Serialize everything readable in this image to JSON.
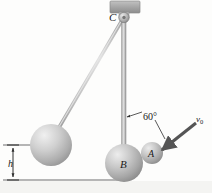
{
  "figure": {
    "background_color": "#fdfdfc",
    "labels": {
      "pivot": "C",
      "sphere_large": "B",
      "sphere_small": "A",
      "angle": "60°",
      "velocity": "v",
      "velocity_subscript": "0",
      "height": "h"
    },
    "colors": {
      "sphere_fill_light": "#e6e6e6",
      "sphere_fill_mid": "#b8b8b8",
      "sphere_fill_dark": "#8e8e8e",
      "rod_light": "#d8d8d8",
      "rod_dark": "#a0a0a0",
      "ceiling_fill": "#a9a9a9",
      "line_color": "#6e6e6e",
      "text_color": "#1a1a1a",
      "arrow_color": "#555555"
    }
  },
  "geometry": {
    "pivot": {
      "x": 124,
      "y": 16
    },
    "sphere_b_rest": {
      "cx": 124,
      "cy": 163,
      "r": 19
    },
    "sphere_b_raised": {
      "cx": 51,
      "cy": 145,
      "r": 21
    },
    "sphere_a": {
      "cx": 152,
      "cy": 153,
      "r": 11
    },
    "ceiling_block": {
      "x": 110,
      "y": 1,
      "w": 30,
      "h": 12
    },
    "ground_line_y": 180,
    "height_line_top_y": 145,
    "velocity_arrow": {
      "x1": 196,
      "y1": 124,
      "x2": 163,
      "y2": 150
    },
    "angle_leader": {
      "x1": 141,
      "y1": 113,
      "x2": 126,
      "y2": 117
    },
    "angle_leader2": {
      "x1": 155,
      "y1": 122,
      "x2": 164,
      "y2": 140
    }
  }
}
